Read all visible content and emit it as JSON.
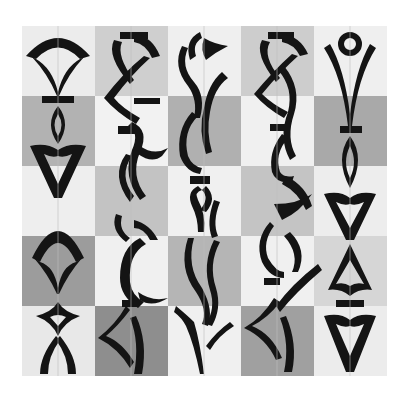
{
  "artwork": {
    "title": "",
    "description": "Five vertical columns of black calligraphic glyph figures over a 5x5 grayscale checkerboard",
    "grid": {
      "rows": 5,
      "cols": 5,
      "cell_colors": [
        [
          "#ececec",
          "#cfcfcf",
          "#efefef",
          "#cdcdcd",
          "#efefef"
        ],
        [
          "#b2b2b2",
          "#f2f2f2",
          "#b0b0b0",
          "#f0f0f0",
          "#a9a9a9"
        ],
        [
          "#eeeeee",
          "#c3c3c3",
          "#f0f0f0",
          "#c4c4c4",
          "#ededed"
        ],
        [
          "#9c9c9c",
          "#f0f0f0",
          "#b5b5b5",
          "#f0f0f0",
          "#d6d6d6"
        ],
        [
          "#e8e8e8",
          "#8e8e8e",
          "#f0f0f0",
          "#a0a0a0",
          "#ececec"
        ]
      ]
    },
    "ink_color": "#141414",
    "columns": [
      {
        "name": "column-1",
        "motifs": [
          "fan-arch",
          "bar",
          "lens",
          "pointed-triangle",
          "fan-arch",
          "diamond",
          "crossed-legs"
        ]
      },
      {
        "name": "column-2",
        "motifs": [
          "hooked-fan",
          "zigzag",
          "bar",
          "s-curve",
          "crescent-hook",
          "arrowhead"
        ]
      },
      {
        "name": "column-3",
        "motifs": [
          "spiral-hook",
          "crescent",
          "bar",
          "s-wave",
          "branch-spike"
        ]
      },
      {
        "name": "column-4",
        "motifs": [
          "hooked-fan",
          "zigzag",
          "bar",
          "s-curve",
          "bar",
          "arrowhead"
        ]
      },
      {
        "name": "column-5",
        "motifs": [
          "ring-v",
          "bar",
          "lens",
          "pointed-triangle",
          "arch-triangle",
          "bar",
          "pointed-triangle"
        ]
      }
    ]
  }
}
